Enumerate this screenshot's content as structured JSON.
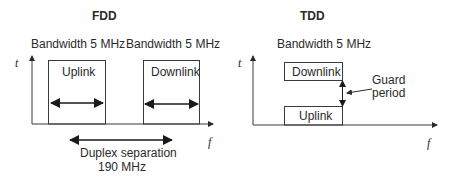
{
  "fdd": {
    "title": "FDD",
    "axis_t": "t",
    "axis_f": "f",
    "uplink": {
      "bandwidth_label": "Bandwidth 5 MHz",
      "box_label": "Uplink"
    },
    "downlink": {
      "bandwidth_label": "Bandwidth 5 MHz",
      "box_label": "Downlink"
    },
    "duplex_separation": {
      "line1": "Duplex separation",
      "line2": "190 MHz"
    }
  },
  "tdd": {
    "title": "TDD",
    "axis_t": "t",
    "axis_f": "f",
    "bandwidth_label": "Bandwidth 5 MHz",
    "downlink_label": "Downlink",
    "uplink_label": "Uplink",
    "guard_period": {
      "line1": "Guard",
      "line2": "period"
    }
  },
  "colors": {
    "line": "#3a3a3a",
    "text": "#2a2a2a",
    "background": "#ffffff"
  }
}
